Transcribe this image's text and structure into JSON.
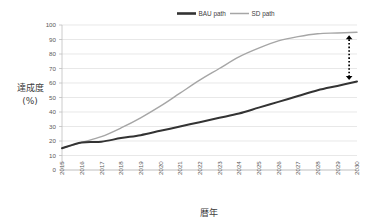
{
  "chart_data": {
    "type": "line",
    "title": "",
    "xlabel": "暦年",
    "ylabel": "達成度\n(%)",
    "ylabel_line1": "達成度",
    "ylabel_line2": "(%)",
    "ylim": [
      0,
      100
    ],
    "ytick_step": 10,
    "yticks": [
      "100",
      "90",
      "80",
      "70",
      "60",
      "50",
      "40",
      "30",
      "20",
      "10",
      "0"
    ],
    "ytick_values": [
      100,
      90,
      80,
      70,
      60,
      50,
      40,
      30,
      20,
      10,
      0
    ],
    "grid": true,
    "legend_position": "top-center",
    "x": [
      2015,
      2016,
      2017,
      2018,
      2019,
      2020,
      2021,
      2022,
      2023,
      2024,
      2025,
      2026,
      2027,
      2028,
      2029,
      2030
    ],
    "categories": [
      "2015",
      "2016",
      "2017",
      "2018",
      "2019",
      "2020",
      "2021",
      "2022",
      "2023",
      "2024",
      "2025",
      "2026",
      "2027",
      "2028",
      "2029",
      "2030"
    ],
    "series": [
      {
        "name": "BAU path",
        "color": "#333333",
        "width": 2.0,
        "values": [
          15,
          19,
          19.5,
          22,
          24,
          27,
          30,
          33,
          36,
          39,
          43,
          47,
          51,
          55,
          58,
          61
        ]
      },
      {
        "name": "SD path",
        "color": "#a6a6a6",
        "width": 1.4,
        "values": [
          15,
          19,
          23,
          29,
          36,
          44,
          53,
          62,
          70,
          78,
          84,
          89,
          92,
          94,
          94.5,
          95
        ]
      }
    ],
    "annotations": [
      {
        "name": "gap-arrow",
        "type": "double-headed-dotted-arrow",
        "x": 2029.6,
        "y_top": 93,
        "y_bottom": 62,
        "color": "#000000"
      }
    ]
  },
  "legend": {
    "items": [
      {
        "label": "BAU path",
        "color": "#333333",
        "swatch": "thick-line-swatch"
      },
      {
        "label": "SD path",
        "color": "#a6a6a6",
        "swatch": "thin-line-swatch"
      }
    ]
  },
  "axes": {
    "y_title_line1": "達成度",
    "y_title_line2": "(%)",
    "x_title": "暦年"
  }
}
